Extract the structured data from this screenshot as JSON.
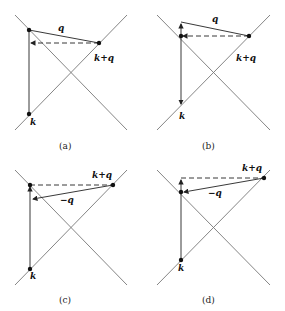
{
  "figure": {
    "line_color": "#666666",
    "vector_color": "#222222",
    "panels": [
      {
        "id": "a",
        "caption": "(a)",
        "labels": {
          "q": "q",
          "kq": "k+q",
          "k": "k"
        }
      },
      {
        "id": "b",
        "caption": "(b)",
        "labels": {
          "q": "q",
          "kq": "k+q",
          "k": "k"
        }
      },
      {
        "id": "c",
        "caption": "(c)",
        "labels": {
          "q": "−q",
          "kq": "k+q",
          "k": "k"
        }
      },
      {
        "id": "d",
        "caption": "(d)",
        "labels": {
          "q": "−q",
          "kq": "k+q",
          "k": "k"
        }
      }
    ]
  }
}
